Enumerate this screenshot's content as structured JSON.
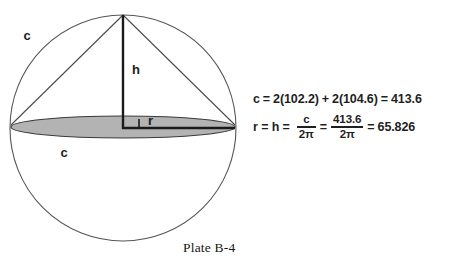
{
  "figure": {
    "caption": "Plate B-4",
    "labels": {
      "arc_c_upper": "c",
      "base_c_lower": "c",
      "height_h": "h",
      "radius_r": "r"
    },
    "colors": {
      "outline": "#555555",
      "ellipse_fill": "#b3b3b3",
      "ellipse_stroke": "#3a3a3a",
      "measure_line": "#1a1a1a",
      "text": "#1a1a1a",
      "background": "#ffffff"
    },
    "geometry": {
      "circle_center_x": 123,
      "circle_center_y": 128,
      "circle_radius": 113,
      "apex_x": 123,
      "apex_y": 15,
      "ellipse_center_x": 123,
      "ellipse_center_y": 127,
      "ellipse_rx": 113,
      "ellipse_ry": 11
    }
  },
  "equations": {
    "line1": {
      "lhs": "c = 2(102.2) + 2(104.6) = 413.6",
      "variable": "c",
      "eq1": "=",
      "term1": "2(102.2)",
      "plus": "+",
      "term2": "2(104.6)",
      "eq2": "=",
      "result": "413.6"
    },
    "line2": {
      "lhs": "r = h =",
      "frac1_num": "c",
      "frac1_den": "2π",
      "eq_mid": "=",
      "frac2_num": "413.6",
      "frac2_den": "2π",
      "eq_end": "=",
      "result": "65.826"
    }
  }
}
